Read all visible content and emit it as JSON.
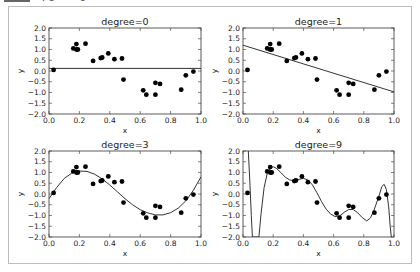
{
  "caption": {
    "fragment": "rô = 0"
  },
  "chart_data": [
    {
      "type": "scatter",
      "title": "degree=0",
      "xlabel": "x",
      "ylabel": "y",
      "xlim": [
        0.0,
        1.0
      ],
      "ylim": [
        -2.0,
        2.0
      ],
      "xticks": [
        "0.0",
        "0.2",
        "0.4",
        "0.6",
        "0.8",
        "1.0"
      ],
      "yticks": [
        "2.0",
        "1.5",
        "1.0",
        "0.5",
        "0.0",
        "-0.5",
        "-1.0",
        "-1.5",
        "-2.0"
      ],
      "grid": false,
      "fit_line": {
        "kind": "polynomial",
        "degree": 0,
        "y_at_0": 0.12,
        "y_at_1": 0.12
      },
      "fit_curve_points": [
        [
          0.0,
          0.12
        ],
        [
          1.0,
          0.12
        ]
      ]
    },
    {
      "type": "scatter",
      "title": "degree=1",
      "xlabel": "x",
      "ylabel": "y",
      "xlim": [
        0.0,
        1.0
      ],
      "ylim": [
        -2.0,
        2.0
      ],
      "xticks": [
        "0.0",
        "0.2",
        "0.4",
        "0.6",
        "0.8",
        "1.0"
      ],
      "yticks": [
        "2.0",
        "1.5",
        "1.0",
        "0.5",
        "0.0",
        "-0.5",
        "-1.0",
        "-1.5",
        "-2.0"
      ],
      "grid": false,
      "fit_line": {
        "kind": "polynomial",
        "degree": 1,
        "y_at_0": 1.2,
        "y_at_1": -0.97
      },
      "fit_curve_points": [
        [
          0.0,
          1.2
        ],
        [
          1.0,
          -0.97
        ]
      ]
    },
    {
      "type": "scatter",
      "title": "degree=3",
      "xlabel": "x",
      "ylabel": "y",
      "xlim": [
        0.0,
        1.0
      ],
      "ylim": [
        -2.0,
        2.0
      ],
      "xticks": [
        "0.0",
        "0.2",
        "0.4",
        "0.6",
        "0.8",
        "1.0"
      ],
      "yticks": [
        "2.0",
        "1.5",
        "1.0",
        "0.5",
        "0.0",
        "-0.5",
        "-1.0",
        "-1.5",
        "-2.0"
      ],
      "grid": false,
      "fit_line": {
        "kind": "polynomial",
        "degree": 3
      },
      "fit_curve_points": [
        [
          0.0,
          -0.22
        ],
        [
          0.05,
          0.3
        ],
        [
          0.1,
          0.72
        ],
        [
          0.15,
          0.97
        ],
        [
          0.2,
          1.07
        ],
        [
          0.25,
          1.05
        ],
        [
          0.3,
          0.92
        ],
        [
          0.35,
          0.7
        ],
        [
          0.4,
          0.42
        ],
        [
          0.45,
          0.1
        ],
        [
          0.5,
          -0.22
        ],
        [
          0.55,
          -0.5
        ],
        [
          0.6,
          -0.73
        ],
        [
          0.65,
          -0.88
        ],
        [
          0.7,
          -0.97
        ],
        [
          0.75,
          -0.97
        ],
        [
          0.8,
          -0.87
        ],
        [
          0.85,
          -0.66
        ],
        [
          0.9,
          -0.32
        ],
        [
          0.95,
          0.17
        ],
        [
          1.0,
          0.8
        ]
      ]
    },
    {
      "type": "scatter",
      "title": "degree=9",
      "xlabel": "x",
      "ylabel": "y",
      "xlim": [
        0.0,
        1.0
      ],
      "ylim": [
        -2.0,
        2.0
      ],
      "xticks": [
        "0.0",
        "0.2",
        "0.4",
        "0.6",
        "0.8",
        "1.0"
      ],
      "yticks": [
        "2.0",
        "1.5",
        "1.0",
        "0.5",
        "0.0",
        "-0.5",
        "-1.0",
        "-1.5",
        "-2.0"
      ],
      "grid": false,
      "fit_line": {
        "kind": "polynomial",
        "degree": 9
      },
      "fit_curve_points": [
        [
          0.035,
          2.0
        ],
        [
          0.045,
          0.6
        ],
        [
          0.055,
          -1.0
        ],
        [
          0.062,
          -2.0
        ],
        [
          0.105,
          -2.0
        ],
        [
          0.12,
          -0.9
        ],
        [
          0.14,
          0.3
        ],
        [
          0.16,
          0.95
        ],
        [
          0.18,
          1.2
        ],
        [
          0.2,
          1.27
        ],
        [
          0.22,
          1.2
        ],
        [
          0.25,
          1.0
        ],
        [
          0.28,
          0.78
        ],
        [
          0.31,
          0.65
        ],
        [
          0.34,
          0.62
        ],
        [
          0.37,
          0.68
        ],
        [
          0.4,
          0.73
        ],
        [
          0.43,
          0.65
        ],
        [
          0.46,
          0.42
        ],
        [
          0.49,
          0.05
        ],
        [
          0.52,
          -0.35
        ],
        [
          0.55,
          -0.7
        ],
        [
          0.58,
          -0.93
        ],
        [
          0.61,
          -1.05
        ],
        [
          0.64,
          -1.02
        ],
        [
          0.67,
          -0.85
        ],
        [
          0.7,
          -0.72
        ],
        [
          0.73,
          -0.72
        ],
        [
          0.76,
          -0.88
        ],
        [
          0.79,
          -1.1
        ],
        [
          0.82,
          -1.25
        ],
        [
          0.845,
          -1.1
        ],
        [
          0.87,
          -0.7
        ],
        [
          0.9,
          -0.1
        ],
        [
          0.92,
          0.35
        ],
        [
          0.935,
          0.45
        ],
        [
          0.95,
          0.2
        ],
        [
          0.965,
          -0.6
        ],
        [
          0.975,
          -1.5
        ],
        [
          0.982,
          -2.0
        ]
      ]
    }
  ],
  "scatter_points": {
    "x": [
      0.03,
      0.16,
      0.18,
      0.18,
      0.19,
      0.24,
      0.29,
      0.34,
      0.35,
      0.39,
      0.43,
      0.48,
      0.49,
      0.62,
      0.64,
      0.7,
      0.7,
      0.73,
      0.87,
      0.9,
      0.95
    ],
    "y": [
      0.05,
      1.05,
      1.25,
      1.0,
      1.0,
      1.27,
      0.47,
      0.6,
      0.63,
      0.82,
      0.55,
      0.58,
      -0.4,
      -0.9,
      -1.1,
      -1.1,
      -0.55,
      -0.6,
      -0.87,
      -0.2,
      -0.03
    ]
  },
  "colors": {
    "points": "#000000",
    "line": "#333333",
    "axes": "#333333",
    "frame": "#bdbdbd"
  }
}
